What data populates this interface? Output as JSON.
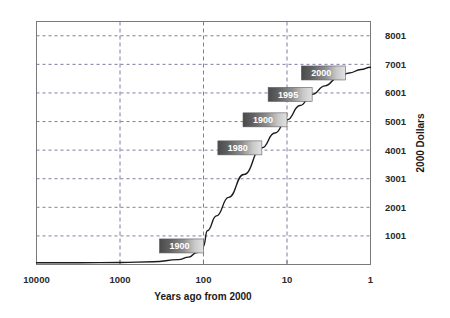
{
  "chart_data": {
    "type": "line",
    "title": "",
    "xlabel": "Years ago from 2000",
    "ylabel": "2000 Dollars",
    "xscale": "log-reversed",
    "xlim": [
      10000,
      1
    ],
    "ylim": [
      1,
      8500
    ],
    "grid": true,
    "legend": false,
    "x_ticks": [
      {
        "label": "10000",
        "value": 10000
      },
      {
        "label": "1000",
        "value": 1000
      },
      {
        "label": "100",
        "value": 100
      },
      {
        "label": "10",
        "value": 10
      },
      {
        "label": "1",
        "value": 1
      }
    ],
    "y_ticks": [
      {
        "label": "1001",
        "value": 1001
      },
      {
        "label": "2001",
        "value": 2001
      },
      {
        "label": "3001",
        "value": 3001
      },
      {
        "label": "4001",
        "value": 4001
      },
      {
        "label": "5001",
        "value": 5001
      },
      {
        "label": "6001",
        "value": 6001
      },
      {
        "label": "7001",
        "value": 7001
      },
      {
        "label": "8001",
        "value": 8001
      }
    ],
    "series": [
      {
        "name": "2000 Dollars",
        "x": [
          10000,
          3000,
          1000,
          400,
          200,
          150,
          120,
          100,
          90,
          70,
          50,
          33,
          20,
          14,
          10,
          7,
          5,
          3.5,
          2.5,
          1.8,
          1.3,
          1
        ],
        "y": [
          60,
          60,
          70,
          95,
          170,
          260,
          420,
          650,
          1180,
          1700,
          2350,
          3150,
          4080,
          4600,
          5060,
          5560,
          5950,
          6250,
          6520,
          6700,
          6820,
          6900
        ]
      }
    ],
    "annotations": [
      {
        "label": "1900",
        "x": 100,
        "y": 650
      },
      {
        "label": "1980",
        "x": 20,
        "y": 4080
      },
      {
        "label": "1900",
        "x": 10,
        "y": 5060
      },
      {
        "label": "1995",
        "x": 5,
        "y": 5950
      },
      {
        "label": "2000",
        "x": 2,
        "y": 6700
      }
    ],
    "colors": {
      "curve": "#1b1b1b",
      "grid": "#6f6f9a",
      "frame": "#7a7a7a",
      "label_dark": "#4a4a4a",
      "label_light": "#d9d9d9",
      "label_text": "#ffffff",
      "tick_text": "#2a2a2a"
    }
  }
}
